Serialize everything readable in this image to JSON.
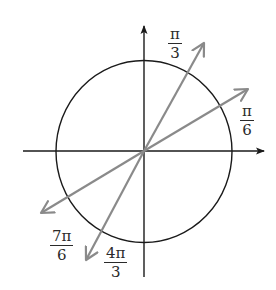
{
  "diagram": {
    "colors": {
      "axis": "#1a1a1a",
      "circle": "#1a1a1a",
      "ray": "#8a8a8a",
      "label": "#2a2a2a",
      "background": "#ffffff"
    },
    "center": {
      "x": 144,
      "y": 151
    },
    "circle": {
      "rx": 88,
      "ry": 91
    },
    "axes": {
      "x": {
        "from": 23,
        "to": 265
      },
      "y": {
        "from": 277,
        "to": 25
      }
    },
    "rays": [
      {
        "name": "pi-over-3",
        "tip": {
          "x": 205,
          "y": 42
        }
      },
      {
        "name": "pi-over-6",
        "tip": {
          "x": 249,
          "y": 88
        }
      },
      {
        "name": "7pi-over-6",
        "tip": {
          "x": 40,
          "y": 214
        }
      },
      {
        "name": "4pi-over-3",
        "tip": {
          "x": 85,
          "y": 261
        }
      }
    ],
    "labels": [
      {
        "id": "pi_3",
        "num": "π",
        "den": "3"
      },
      {
        "id": "pi_6",
        "num": "π",
        "den": "6"
      },
      {
        "id": "7pi_6",
        "num": "7π",
        "den": "6"
      },
      {
        "id": "4pi_3",
        "num": "4π",
        "den": "3"
      }
    ]
  }
}
